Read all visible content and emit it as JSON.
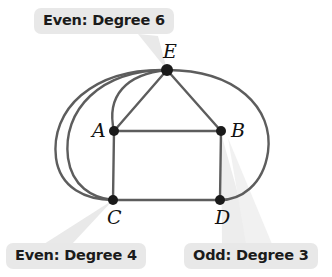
{
  "figure": {
    "background_color": "#ffffff",
    "edge_color": "#5a5a5a",
    "vertex_color": "#1a1a1a",
    "callout_bg_color": "#e8e8e8",
    "callout_text_color": "#1b1b1b",
    "pointer_color": "#e4e4e4"
  },
  "callouts": [
    {
      "id": "callout-e",
      "label": "Even: Degree 6",
      "points_to": "E"
    },
    {
      "id": "callout-c",
      "label": "Even: Degree 4",
      "points_to": "C"
    },
    {
      "id": "callout-d",
      "label": "Odd: Degree 3",
      "points_to": "B"
    }
  ],
  "graph_data": {
    "type": "graph",
    "vertices": [
      {
        "id": "A",
        "label": "A",
        "x": 114,
        "y": 131,
        "degree": 4,
        "parity": "Even"
      },
      {
        "id": "B",
        "label": "B",
        "x": 221,
        "y": 131,
        "degree": 3,
        "parity": "Odd"
      },
      {
        "id": "C",
        "label": "C",
        "x": 113,
        "y": 200,
        "degree": 4,
        "parity": "Even"
      },
      {
        "id": "D",
        "label": "D",
        "x": 220,
        "y": 200,
        "degree": 3,
        "parity": "Odd"
      },
      {
        "id": "E",
        "label": "E",
        "x": 167,
        "y": 70,
        "degree": 6,
        "parity": "Even"
      }
    ],
    "vertex_label_offsets": [
      {
        "id": "A",
        "dx": -22,
        "dy": 6
      },
      {
        "id": "B",
        "dx": 10,
        "dy": 6
      },
      {
        "id": "C",
        "dx": -6,
        "dy": 24
      },
      {
        "id": "D",
        "dx": -5,
        "dy": 24
      },
      {
        "id": "E",
        "dx": -4,
        "dy": -12
      }
    ],
    "edges": [
      {
        "from": "A",
        "to": "B",
        "style": "straight"
      },
      {
        "from": "A",
        "to": "C",
        "style": "straight"
      },
      {
        "from": "B",
        "to": "D",
        "style": "straight"
      },
      {
        "from": "C",
        "to": "D",
        "style": "straight"
      },
      {
        "from": "E",
        "to": "A",
        "style": "straight"
      },
      {
        "from": "E",
        "to": "B",
        "style": "straight"
      },
      {
        "from": "E",
        "to": "A",
        "style": "arc-left-inner"
      },
      {
        "from": "E",
        "to": "C",
        "style": "arc-left-mid"
      },
      {
        "from": "E",
        "to": "C",
        "style": "arc-left-outer"
      },
      {
        "from": "E",
        "to": "D",
        "style": "arc-right"
      }
    ]
  }
}
